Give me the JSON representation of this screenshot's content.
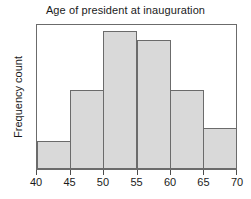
{
  "chart_data": {
    "type": "bar",
    "title": "Age of president at inauguration",
    "xlabel": "",
    "ylabel": "Frequency count",
    "bin_edges": [
      40,
      45,
      50,
      55,
      60,
      65,
      70
    ],
    "categories": [
      "40-45",
      "45-50",
      "50-55",
      "55-60",
      "60-65",
      "65-70"
    ],
    "values": [
      2,
      7,
      10,
      9,
      7,
      3
    ],
    "xlim": [
      40,
      70
    ],
    "ylim": [
      0,
      10.4
    ],
    "xticks": [
      "40",
      "45",
      "50",
      "55",
      "60",
      "65",
      "70"
    ],
    "yticks": [],
    "grid": false,
    "legend": null,
    "bar_fill_color": "#d9d9d9",
    "bar_edge_color": "#6b6b6b",
    "frame_color": "#6b6b6b",
    "text_color": "#1a1a1a",
    "background_color": "#ffffff",
    "bars": [
      {
        "label": "40-45",
        "left_pct": 0,
        "width_pct": 16.6667,
        "height_pct": 19.23
      },
      {
        "label": "45-50",
        "left_pct": 16.6667,
        "width_pct": 16.6667,
        "height_pct": 54.81
      },
      {
        "label": "50-55",
        "left_pct": 33.3333,
        "width_pct": 16.6667,
        "height_pct": 95.89
      },
      {
        "label": "55-60",
        "left_pct": 50.0,
        "width_pct": 16.6667,
        "height_pct": 89.73
      },
      {
        "label": "60-65",
        "left_pct": 66.6667,
        "width_pct": 16.6667,
        "height_pct": 54.81
      },
      {
        "label": "65-70",
        "left_pct": 83.3333,
        "width_pct": 16.6667,
        "height_pct": 28.77
      }
    ],
    "tick_positions_pct": [
      0,
      16.6667,
      33.3333,
      50.0,
      66.6667,
      83.3333,
      100
    ]
  }
}
